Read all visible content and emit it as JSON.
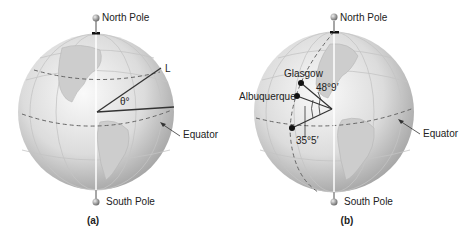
{
  "figure_a": {
    "caption": "(a)",
    "north_label": "North Pole",
    "south_label": "South Pole",
    "equator_label": "Equator",
    "line_label": "L",
    "angle_label": "θ°"
  },
  "figure_b": {
    "caption": "(b)",
    "north_label": "North Pole",
    "south_label": "South Pole",
    "equator_label": "Equator",
    "city1": "Glasgow",
    "city2": "Albuquerque",
    "angle1": "48°9′",
    "angle2": "35°5′"
  },
  "colors": {
    "globe_light": "#f4f4f4",
    "globe_dark": "#a9a9a9",
    "line": "#333333",
    "dash": "#666666"
  }
}
